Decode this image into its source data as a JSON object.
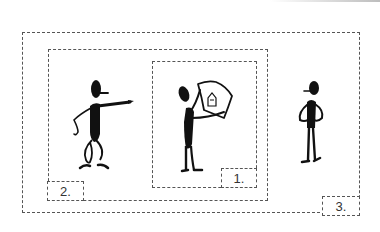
{
  "diagram": {
    "frames": [
      {
        "id": "frame-1",
        "label": "1.",
        "content": "figure holding up a sheet with a house symbol"
      },
      {
        "id": "frame-2",
        "label": "2.",
        "content": "figure pointing toward frame 1"
      },
      {
        "id": "frame-3",
        "label": "3.",
        "content": "figure standing with hands on hips, observing"
      }
    ]
  },
  "colors": {
    "ink": "#111111",
    "dash": "#555555",
    "background": "#ffffff"
  }
}
